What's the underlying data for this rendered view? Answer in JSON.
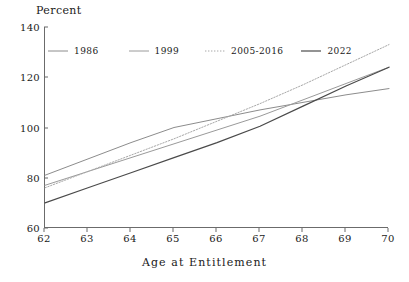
{
  "chart_data": {
    "type": "line",
    "title": "",
    "ylabel": "Percent",
    "xlabel": "Age at Entitlement",
    "xlim": [
      62,
      70
    ],
    "ylim": [
      60,
      140
    ],
    "xticks": [
      62,
      63,
      64,
      65,
      66,
      67,
      68,
      69,
      70
    ],
    "yticks": [
      60,
      80,
      100,
      120,
      140
    ],
    "xtick_labels": [
      "62",
      "63",
      "64",
      "65",
      "66",
      "67",
      "68",
      "69",
      "70"
    ],
    "ytick_labels": [
      "60",
      "80",
      "100",
      "120",
      "140"
    ],
    "grid": false,
    "legend_position": "top-left-inside",
    "x": [
      62,
      63,
      64,
      65,
      66,
      67,
      68,
      69,
      70
    ],
    "series": [
      {
        "name": "1986",
        "color": "#8c8c8c",
        "style": "solid",
        "width": 1,
        "values": [
          81.0,
          87.5,
          94.0,
          100.0,
          103.5,
          107.0,
          110.0,
          113.0,
          115.5
        ]
      },
      {
        "name": "1999",
        "color": "#9a9a9a",
        "style": "solid",
        "width": 1,
        "values": [
          77.0,
          82.5,
          88.0,
          93.5,
          99.0,
          104.5,
          111.0,
          117.5,
          124.0
        ]
      },
      {
        "name": "2005-2016",
        "color": "#a8a8a8",
        "style": "dotted",
        "width": 1,
        "values": [
          76.0,
          82.5,
          89.0,
          95.5,
          102.5,
          109.5,
          117.0,
          125.0,
          133.0
        ]
      },
      {
        "name": "2022",
        "color": "#4a4a4a",
        "style": "solid",
        "width": 1.2,
        "values": [
          70.0,
          76.0,
          82.0,
          88.0,
          94.0,
          100.5,
          108.5,
          116.5,
          124.0
        ]
      }
    ]
  },
  "legend": {
    "items": [
      {
        "label": "1986"
      },
      {
        "label": "1999"
      },
      {
        "label": "2005-2016"
      },
      {
        "label": "2022"
      }
    ]
  }
}
